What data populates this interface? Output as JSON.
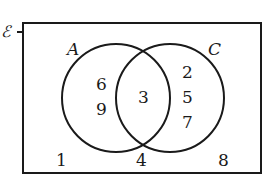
{
  "diagram": {
    "type": "venn",
    "universal_label": "ℰ",
    "sets": [
      {
        "name": "A",
        "only": [
          "6",
          "9"
        ]
      },
      {
        "name": "C",
        "only": [
          "2",
          "5",
          "7"
        ]
      }
    ],
    "intersection": [
      "3"
    ],
    "outside": [
      "1",
      "4",
      "8"
    ],
    "colors": {
      "stroke": "#1a1a1a",
      "background": "#ffffff"
    }
  }
}
